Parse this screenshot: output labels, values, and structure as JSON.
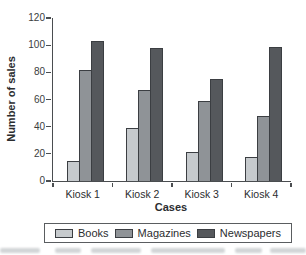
{
  "chart_data": {
    "type": "bar",
    "title": "",
    "xlabel": "Cases",
    "ylabel": "Number of sales",
    "categories": [
      "Kiosk 1",
      "Kiosk 2",
      "Kiosk 3",
      "Kiosk 4"
    ],
    "series": [
      {
        "name": "Books",
        "color": "#c6cacd",
        "values": [
          15,
          39,
          21,
          18
        ]
      },
      {
        "name": "Magazines",
        "color": "#8f9397",
        "values": [
          82,
          67,
          59,
          48
        ]
      },
      {
        "name": "Newspapers",
        "color": "#55585c",
        "values": [
          103,
          98,
          75,
          99
        ]
      }
    ],
    "ylim": [
      0,
      120
    ],
    "yticks": [
      0,
      20,
      40,
      60,
      80,
      100,
      120
    ],
    "grid": false,
    "legend_position": "bottom",
    "bar_border_color": "#3b3e42",
    "axis_color": "#4a4d50"
  }
}
